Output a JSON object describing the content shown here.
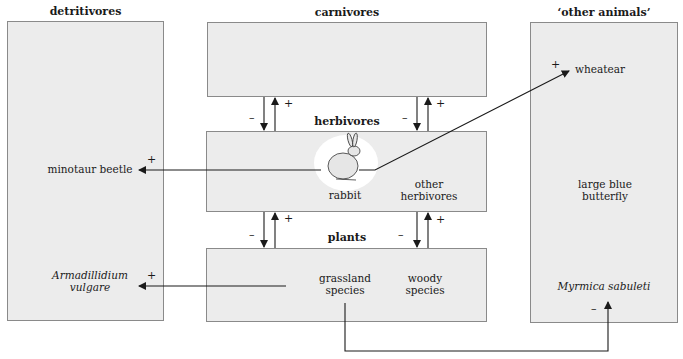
{
  "groups": {
    "detritivores": {
      "title": "detritivores",
      "species": [
        "minotaur beetle",
        "Armadillidium vulgare"
      ]
    },
    "carnivores": {
      "title": "carnivores"
    },
    "herbivores": {
      "title": "herbivores",
      "species": [
        "rabbit",
        "other herbivores"
      ]
    },
    "plants": {
      "title": "plants",
      "species": [
        "grassland species",
        "woody species"
      ]
    },
    "other_animals": {
      "title": "‘other animals’",
      "species": [
        "wheatear",
        "large blue butterfly",
        "Myrmica sabuleti"
      ]
    }
  },
  "labels": {
    "minotaur_beetle": "minotaur beetle",
    "armadillidium_1": "Armadillidium",
    "armadillidium_2": "vulgare",
    "rabbit": "rabbit",
    "other_herb_1": "other",
    "other_herb_2": "herbivores",
    "grassland_1": "grassland",
    "grassland_2": "species",
    "woody_1": "woody",
    "woody_2": "species",
    "wheatear": "wheatear",
    "butterfly_1": "large blue",
    "butterfly_2": "butterfly",
    "myrmica": "Myrmica sabuleti"
  },
  "signs": {
    "plus": "+",
    "minus": "–"
  },
  "interactions": [
    {
      "from": "carnivores",
      "to": "herbivores",
      "effect": "-"
    },
    {
      "from": "herbivores",
      "to": "carnivores",
      "effect": "+"
    },
    {
      "from": "herbivores",
      "to": "plants",
      "effect": "-"
    },
    {
      "from": "plants",
      "to": "herbivores",
      "effect": "+"
    },
    {
      "from": "rabbit",
      "to": "minotaur beetle",
      "effect": "+"
    },
    {
      "from": "rabbit",
      "to": "wheatear",
      "effect": "+"
    },
    {
      "from": "plants",
      "to": "Armadillidium vulgare",
      "effect": "+"
    },
    {
      "from": "grassland species",
      "to": "Myrmica sabuleti",
      "effect": "-"
    }
  ],
  "colors": {
    "box_fill": "#ececec",
    "box_border": "#8a8a8a",
    "line": "#1a1a1a"
  }
}
